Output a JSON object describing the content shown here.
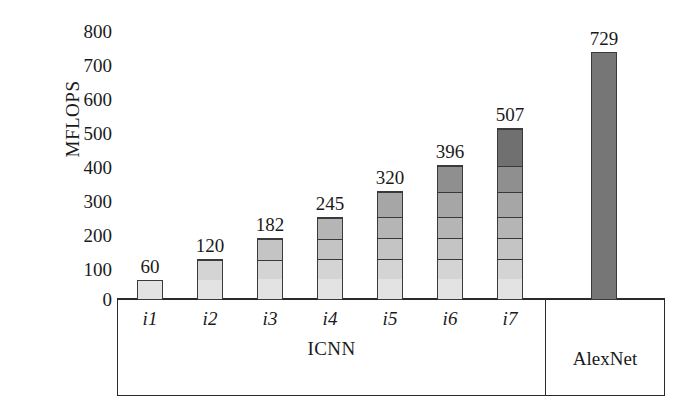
{
  "chart_data": {
    "type": "bar",
    "title": "",
    "xlabel": "ICNN",
    "ylabel": "MFLOPS",
    "categories": [
      "i1",
      "i2",
      "i3",
      "i4",
      "i5",
      "i6",
      "i7",
      "AlexNet"
    ],
    "values": [
      60,
      120,
      182,
      245,
      320,
      396,
      507,
      729
    ],
    "value_labels": [
      "60",
      "120",
      "182",
      "245",
      "320",
      "396",
      "507",
      "729"
    ],
    "ylim": [
      0,
      800
    ],
    "yticks": [
      800,
      700,
      600,
      500,
      400,
      300,
      200,
      100,
      0
    ],
    "ytick_labels": [
      "800",
      "700",
      "600",
      "500",
      "400",
      "300",
      "200",
      "100",
      "0"
    ],
    "grid": false,
    "legend": "none",
    "groups": [
      {
        "name": "ICNN",
        "categories": [
          "i1",
          "i2",
          "i3",
          "i4",
          "i5",
          "i6",
          "i7"
        ]
      },
      {
        "name": "AlexNet",
        "categories": [
          "AlexNet"
        ]
      }
    ],
    "stacked": true,
    "series": [
      {
        "name": "layer 1",
        "values": [
          60,
          60,
          60,
          60,
          60,
          60,
          60,
          null
        ]
      },
      {
        "name": "layer 2",
        "values": [
          null,
          60,
          60,
          60,
          60,
          60,
          60,
          null
        ]
      },
      {
        "name": "layer 3",
        "values": [
          null,
          null,
          62,
          62,
          62,
          62,
          62,
          null
        ]
      },
      {
        "name": "layer 4",
        "values": [
          null,
          null,
          null,
          63,
          63,
          63,
          63,
          null
        ]
      },
      {
        "name": "layer 5",
        "values": [
          null,
          null,
          null,
          null,
          75,
          75,
          75,
          null
        ]
      },
      {
        "name": "layer 6",
        "values": [
          null,
          null,
          null,
          null,
          null,
          76,
          76,
          null
        ]
      },
      {
        "name": "layer 7",
        "values": [
          null,
          null,
          null,
          null,
          null,
          null,
          111,
          null
        ]
      },
      {
        "name": "AlexNet total",
        "values": [
          null,
          null,
          null,
          null,
          null,
          null,
          null,
          729
        ]
      }
    ],
    "segment_colors": [
      "#e3e3e3",
      "#d4d4d4",
      "#c4c4c4",
      "#b5b5b5",
      "#a6a6a6",
      "#8f8f8f",
      "#707070"
    ],
    "alexnet_color": "#767676",
    "bar_outline_color": "#3a3a3a",
    "axis_color": "#2a2a2a"
  },
  "axis": {
    "y_title": "MFLOPS",
    "x_group_icnn": "ICNN",
    "x_group_alexnet": "AlexNet"
  }
}
